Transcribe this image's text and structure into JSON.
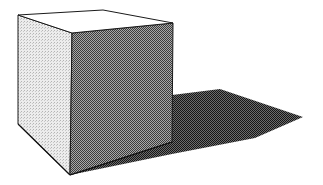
{
  "illustration": {
    "subject": "cube with cast shadow",
    "style": "halftone dither shading",
    "colors": {
      "background": "#ffffff",
      "outline": "#1a1a1a",
      "top_face": "#ffffff",
      "left_face_light": "#e6e6e6",
      "left_face_dot": "#b0b0b0",
      "front_face_light": "#9a9a9a",
      "front_face_dark": "#3a3a3a",
      "shadow_light": "#6a6a6a",
      "shadow_dark": "#1e1e1e"
    },
    "vertices": {
      "top_back_left": [
        18,
        15
      ],
      "top_back_right": [
        103,
        10
      ],
      "top_front_right": [
        173,
        23
      ],
      "top_front_left": [
        72,
        33
      ],
      "bottom_left": [
        18,
        124
      ],
      "bottom_front": [
        70,
        175
      ],
      "bottom_right": [
        172,
        142
      ]
    },
    "shadow": {
      "points": [
        [
          172,
          95
        ],
        [
          220,
          89
        ],
        [
          303,
          117
        ],
        [
          255,
          138
        ],
        [
          172,
          154
        ],
        [
          70,
          175
        ],
        [
          172,
          142
        ]
      ]
    }
  }
}
